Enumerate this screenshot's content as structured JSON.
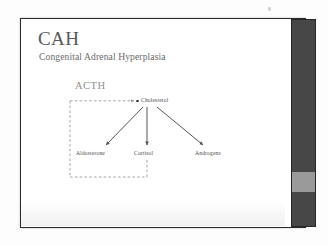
{
  "slide": {
    "title": "CAH",
    "subtitle": "Congenital Adrenal Hyperplasia"
  },
  "diagram": {
    "type": "flow",
    "stimulus_label": "ACTH",
    "nodes": [
      {
        "id": "cholesterol",
        "label": "Cholesterol"
      },
      {
        "id": "aldosterone",
        "label": "Aldosterone"
      },
      {
        "id": "cortisol",
        "label": "Cortisol"
      },
      {
        "id": "androgens",
        "label": "Androgens"
      }
    ],
    "arrows": [
      {
        "from": "cholesterol",
        "to": "aldosterone",
        "style": "solid"
      },
      {
        "from": "cholesterol",
        "to": "cortisol",
        "style": "solid"
      },
      {
        "from": "cholesterol",
        "to": "androgens",
        "style": "solid"
      }
    ],
    "feedback_loop": {
      "from": "cortisol",
      "to": "cholesterol",
      "style": "dashed",
      "description": "negative feedback loop from Cortisol back to ACTH / Cholesterol"
    }
  },
  "colors": {
    "title_text": "#595959",
    "subtitle_text": "#6a6a6a",
    "node_text": "#4d4d4d",
    "acth_text": "#8e8e8e",
    "arrow": "#555555",
    "dashed_line": "#9c9c9c",
    "slide_border": "#2b2b2e",
    "scrollbar_track": "#474747",
    "scrollbar_thumb": "#9a9a9a",
    "slide_background": "#ffffff"
  },
  "scrollbar": {
    "orientation": "vertical",
    "thumb_position_label": "near-bottom"
  }
}
